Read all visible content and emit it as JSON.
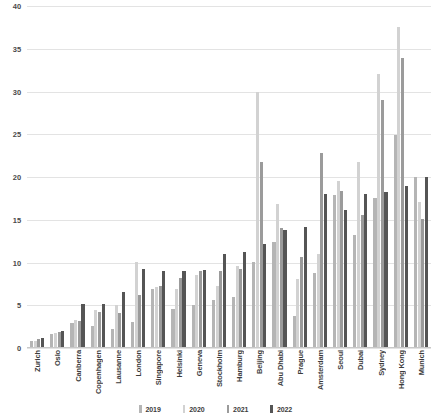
{
  "chart_data": {
    "type": "bar",
    "title": "",
    "subtitle": "",
    "xlabel": "",
    "ylabel": "",
    "ylim": [
      0,
      40
    ],
    "yticks": [
      0,
      5,
      10,
      15,
      20,
      25,
      30,
      35,
      40
    ],
    "ytick_labels": [
      "0",
      "5",
      "10",
      "15",
      "20",
      "25",
      "30",
      "35",
      "40"
    ],
    "grid": true,
    "legend_position": "bottom",
    "categories": [
      "Zurich",
      "Oslo",
      "Canberra",
      "Copenhagen",
      "Lausanne",
      "London",
      "Singapore",
      "Helsinki",
      "Geneva",
      "Stockholm",
      "Hamburg",
      "Beijing",
      "Abu Dhabi",
      "Prague",
      "Amsterdam",
      "Seoul",
      "Dubai",
      "Sydney",
      "Hong Kong",
      "Munich"
    ],
    "series": [
      {
        "name": "2019",
        "color": "#b5b5b5",
        "values": [
          0.8,
          1.6,
          2.9,
          2.6,
          2.2,
          3.0,
          6.9,
          4.6,
          5.0,
          5.6,
          6.0,
          10.1,
          12.4,
          3.8,
          8.8,
          17.9,
          13.2,
          17.5,
          24.9,
          20.0
        ]
      },
      {
        "name": "2020",
        "color": "#d2d2d2",
        "values": [
          0.8,
          1.8,
          3.3,
          4.4,
          5.0,
          10.1,
          7.1,
          6.9,
          8.5,
          7.2,
          9.6,
          30.0,
          16.8,
          8.1,
          11.0,
          19.5,
          21.8,
          32.0,
          37.5,
          17.1
        ]
      },
      {
        "name": "2021",
        "color": "#9b9b9b",
        "values": [
          1.1,
          1.9,
          3.2,
          4.2,
          4.1,
          6.2,
          7.2,
          8.2,
          9.0,
          9.0,
          9.3,
          21.8,
          14.0,
          10.7,
          22.8,
          18.4,
          15.5,
          29.0,
          33.9,
          15.1
        ]
      },
      {
        "name": "2022",
        "color": "#555555",
        "values": [
          1.2,
          2.0,
          5.2,
          5.2,
          6.5,
          9.3,
          9.0,
          9.0,
          9.1,
          11.0,
          11.2,
          12.2,
          13.8,
          14.2,
          18.0,
          16.2,
          18.0,
          18.2,
          19.0,
          20.0
        ]
      }
    ]
  },
  "legend": {
    "entries": [
      {
        "label": "2019",
        "color": "#b5b5b5"
      },
      {
        "label": "2020",
        "color": "#d2d2d2"
      },
      {
        "label": "2021",
        "color": "#9b9b9b"
      },
      {
        "label": "2022",
        "color": "#555555"
      }
    ]
  }
}
